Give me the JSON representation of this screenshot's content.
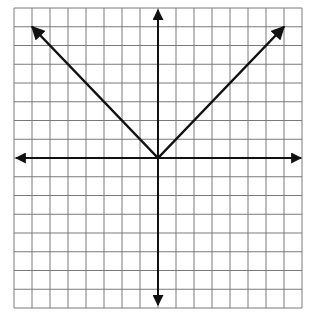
{
  "chart_data": {
    "type": "line",
    "title": "",
    "grid": {
      "columns": 16,
      "rows": 16,
      "shown": true
    },
    "xlim": [
      -8,
      8
    ],
    "ylim": [
      -8,
      8
    ],
    "xlabel": "",
    "ylabel": "",
    "axes": {
      "x_arrows": true,
      "y_arrows": true
    },
    "series": [
      {
        "name": "y = |x|",
        "x": [
          -7,
          0,
          7
        ],
        "y": [
          7,
          0,
          7
        ],
        "arrows_at_ends": true
      }
    ]
  },
  "colors": {
    "grid": "#7a7a7a",
    "axis": "#111111",
    "line": "#111111",
    "background": "#ffffff"
  }
}
